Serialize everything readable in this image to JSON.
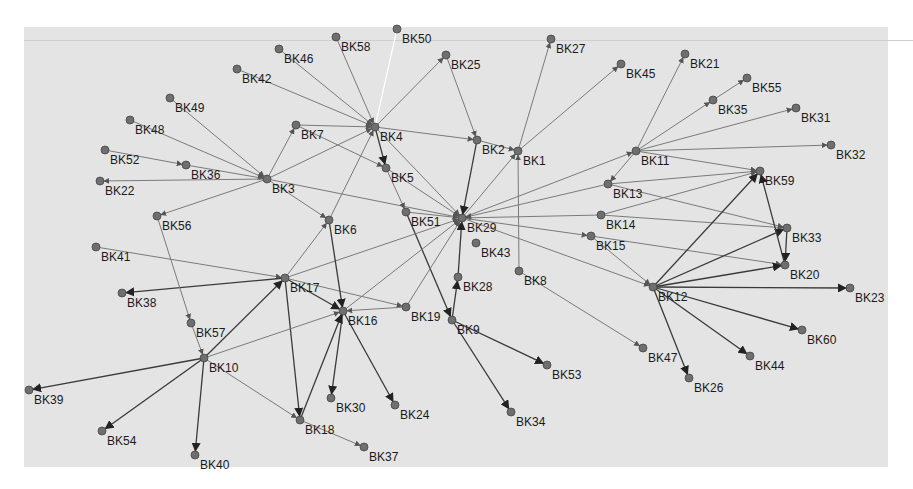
{
  "diagram": {
    "type": "directed-network-graph",
    "background": "#e4e4e4",
    "node_color": "#6f6f6f",
    "edge_color": "#7a7a7a",
    "nodes": [
      {
        "id": "BK1",
        "x": 518,
        "y": 151
      },
      {
        "id": "BK2",
        "x": 477,
        "y": 140
      },
      {
        "id": "BK3",
        "x": 267,
        "y": 179
      },
      {
        "id": "BK4",
        "x": 375,
        "y": 127
      },
      {
        "id": "BK5",
        "x": 386,
        "y": 168
      },
      {
        "id": "BK6",
        "x": 329,
        "y": 220
      },
      {
        "id": "BK7",
        "x": 296,
        "y": 125
      },
      {
        "id": "BK8",
        "x": 519,
        "y": 271
      },
      {
        "id": "BK9",
        "x": 452,
        "y": 320
      },
      {
        "id": "BK10",
        "x": 204,
        "y": 358
      },
      {
        "id": "BK11",
        "x": 636,
        "y": 151
      },
      {
        "id": "BK12",
        "x": 653,
        "y": 287
      },
      {
        "id": "BK13",
        "x": 608,
        "y": 184
      },
      {
        "id": "BK14",
        "x": 601,
        "y": 215
      },
      {
        "id": "BK15",
        "x": 591,
        "y": 236
      },
      {
        "id": "BK16",
        "x": 343,
        "y": 311
      },
      {
        "id": "BK17",
        "x": 285,
        "y": 278
      },
      {
        "id": "BK18",
        "x": 300,
        "y": 420
      },
      {
        "id": "BK19",
        "x": 406,
        "y": 307
      },
      {
        "id": "BK20",
        "x": 785,
        "y": 265
      },
      {
        "id": "BK21",
        "x": 685,
        "y": 54
      },
      {
        "id": "BK22",
        "x": 100,
        "y": 181
      },
      {
        "id": "BK23",
        "x": 850,
        "y": 288
      },
      {
        "id": "BK24",
        "x": 395,
        "y": 405
      },
      {
        "id": "BK25",
        "x": 446,
        "y": 55
      },
      {
        "id": "BK26",
        "x": 689,
        "y": 378
      },
      {
        "id": "BK27",
        "x": 551,
        "y": 39
      },
      {
        "id": "BK28",
        "x": 458,
        "y": 277
      },
      {
        "id": "BK29",
        "x": 462,
        "y": 218
      },
      {
        "id": "BK30",
        "x": 331,
        "y": 398
      },
      {
        "id": "BK31",
        "x": 796,
        "y": 108
      },
      {
        "id": "BK32",
        "x": 831,
        "y": 145
      },
      {
        "id": "BK33",
        "x": 787,
        "y": 228
      },
      {
        "id": "BK34",
        "x": 511,
        "y": 412
      },
      {
        "id": "BK35",
        "x": 713,
        "y": 100
      },
      {
        "id": "BK36",
        "x": 186,
        "y": 165
      },
      {
        "id": "BK37",
        "x": 364,
        "y": 447
      },
      {
        "id": "BK38",
        "x": 122,
        "y": 293
      },
      {
        "id": "BK39",
        "x": 29,
        "y": 390
      },
      {
        "id": "BK40",
        "x": 195,
        "y": 455
      },
      {
        "id": "BK41",
        "x": 96,
        "y": 247
      },
      {
        "id": "BK42",
        "x": 237,
        "y": 69
      },
      {
        "id": "BK43",
        "x": 476,
        "y": 243
      },
      {
        "id": "BK44",
        "x": 750,
        "y": 356
      },
      {
        "id": "BK45",
        "x": 621,
        "y": 64
      },
      {
        "id": "BK46",
        "x": 279,
        "y": 49
      },
      {
        "id": "BK47",
        "x": 643,
        "y": 348
      },
      {
        "id": "BK48",
        "x": 130,
        "y": 120
      },
      {
        "id": "BK49",
        "x": 170,
        "y": 98
      },
      {
        "id": "BK50",
        "x": 397,
        "y": 29
      },
      {
        "id": "BK51",
        "x": 406,
        "y": 212
      },
      {
        "id": "BK52",
        "x": 105,
        "y": 150
      },
      {
        "id": "BK53",
        "x": 547,
        "y": 365
      },
      {
        "id": "BK54",
        "x": 102,
        "y": 431
      },
      {
        "id": "BK55",
        "x": 747,
        "y": 78
      },
      {
        "id": "BK56",
        "x": 157,
        "y": 216
      },
      {
        "id": "BK57",
        "x": 191,
        "y": 323
      },
      {
        "id": "BK58",
        "x": 336,
        "y": 37
      },
      {
        "id": "BK59",
        "x": 760,
        "y": 171
      },
      {
        "id": "BK60",
        "x": 802,
        "y": 330
      }
    ],
    "edges": [
      {
        "from": "BK46",
        "to": "BK4"
      },
      {
        "from": "BK42",
        "to": "BK4"
      },
      {
        "from": "BK58",
        "to": "BK4"
      },
      {
        "from": "BK4",
        "to": "BK50",
        "style": "light"
      },
      {
        "from": "BK4",
        "to": "BK25"
      },
      {
        "from": "BK7",
        "to": "BK4"
      },
      {
        "from": "BK4",
        "to": "BK5",
        "style": "dark"
      },
      {
        "from": "BK4",
        "to": "BK2"
      },
      {
        "from": "BK4",
        "to": "BK29"
      },
      {
        "from": "BK3",
        "to": "BK4"
      },
      {
        "from": "BK3",
        "to": "BK7"
      },
      {
        "from": "BK49",
        "to": "BK3"
      },
      {
        "from": "BK48",
        "to": "BK3"
      },
      {
        "from": "BK52",
        "to": "BK36"
      },
      {
        "from": "BK36",
        "to": "BK3"
      },
      {
        "from": "BK3",
        "to": "BK22"
      },
      {
        "from": "BK3",
        "to": "BK56"
      },
      {
        "from": "BK3",
        "to": "BK6"
      },
      {
        "from": "BK3",
        "to": "BK29"
      },
      {
        "from": "BK7",
        "to": "BK5"
      },
      {
        "from": "BK5",
        "to": "BK51"
      },
      {
        "from": "BK5",
        "to": "BK29"
      },
      {
        "from": "BK51",
        "to": "BK29"
      },
      {
        "from": "BK51",
        "to": "BK9",
        "style": "dark"
      },
      {
        "from": "BK25",
        "to": "BK2"
      },
      {
        "from": "BK2",
        "to": "BK1"
      },
      {
        "from": "BK2",
        "to": "BK29",
        "style": "dark"
      },
      {
        "from": "BK1",
        "to": "BK27"
      },
      {
        "from": "BK1",
        "to": "BK45"
      },
      {
        "from": "BK29",
        "to": "BK1"
      },
      {
        "from": "BK8",
        "to": "BK1"
      },
      {
        "from": "BK29",
        "to": "BK11"
      },
      {
        "from": "BK13",
        "to": "BK29"
      },
      {
        "from": "BK14",
        "to": "BK29"
      },
      {
        "from": "BK29",
        "to": "BK15"
      },
      {
        "from": "BK29",
        "to": "BK12"
      },
      {
        "from": "BK17",
        "to": "BK29"
      },
      {
        "from": "BK16",
        "to": "BK29"
      },
      {
        "from": "BK19",
        "to": "BK29"
      },
      {
        "from": "BK28",
        "to": "BK29",
        "style": "dark"
      },
      {
        "from": "BK9",
        "to": "BK28",
        "style": "dark"
      },
      {
        "from": "BK9",
        "to": "BK53",
        "style": "dark"
      },
      {
        "from": "BK9",
        "to": "BK34",
        "style": "dark"
      },
      {
        "from": "BK8",
        "to": "BK47"
      },
      {
        "from": "BK11",
        "to": "BK21"
      },
      {
        "from": "BK11",
        "to": "BK35"
      },
      {
        "from": "BK35",
        "to": "BK55"
      },
      {
        "from": "BK11",
        "to": "BK31"
      },
      {
        "from": "BK11",
        "to": "BK32"
      },
      {
        "from": "BK11",
        "to": "BK59"
      },
      {
        "from": "BK11",
        "to": "BK13"
      },
      {
        "from": "BK13",
        "to": "BK59"
      },
      {
        "from": "BK13",
        "to": "BK33"
      },
      {
        "from": "BK14",
        "to": "BK59"
      },
      {
        "from": "BK14",
        "to": "BK33"
      },
      {
        "from": "BK15",
        "to": "BK20"
      },
      {
        "from": "BK15",
        "to": "BK12"
      },
      {
        "from": "BK12",
        "to": "BK59",
        "style": "dark"
      },
      {
        "from": "BK12",
        "to": "BK33",
        "style": "dark"
      },
      {
        "from": "BK12",
        "to": "BK20",
        "style": "dark"
      },
      {
        "from": "BK20",
        "to": "BK59",
        "style": "dark"
      },
      {
        "from": "BK33",
        "to": "BK20",
        "style": "dark"
      },
      {
        "from": "BK12",
        "to": "BK23",
        "style": "dark"
      },
      {
        "from": "BK12",
        "to": "BK60",
        "style": "dark"
      },
      {
        "from": "BK12",
        "to": "BK44",
        "style": "dark"
      },
      {
        "from": "BK12",
        "to": "BK26",
        "style": "dark"
      },
      {
        "from": "BK41",
        "to": "BK17"
      },
      {
        "from": "BK17",
        "to": "BK38",
        "style": "dark"
      },
      {
        "from": "BK17",
        "to": "BK6"
      },
      {
        "from": "BK17",
        "to": "BK16",
        "style": "dark"
      },
      {
        "from": "BK17",
        "to": "BK19"
      },
      {
        "from": "BK17",
        "to": "BK18",
        "style": "dark"
      },
      {
        "from": "BK6",
        "to": "BK4"
      },
      {
        "from": "BK6",
        "to": "BK16",
        "style": "dark"
      },
      {
        "from": "BK19",
        "to": "BK16"
      },
      {
        "from": "BK16",
        "to": "BK30",
        "style": "dark"
      },
      {
        "from": "BK16",
        "to": "BK24",
        "style": "dark"
      },
      {
        "from": "BK18",
        "to": "BK16",
        "style": "dark"
      },
      {
        "from": "BK18",
        "to": "BK37"
      },
      {
        "from": "BK56",
        "to": "BK57"
      },
      {
        "from": "BK57",
        "to": "BK10"
      },
      {
        "from": "BK10",
        "to": "BK17",
        "style": "dark"
      },
      {
        "from": "BK10",
        "to": "BK16"
      },
      {
        "from": "BK10",
        "to": "BK39",
        "style": "dark"
      },
      {
        "from": "BK10",
        "to": "BK54",
        "style": "dark"
      },
      {
        "from": "BK10",
        "to": "BK40",
        "style": "dark"
      },
      {
        "from": "BK10",
        "to": "BK18"
      }
    ]
  }
}
